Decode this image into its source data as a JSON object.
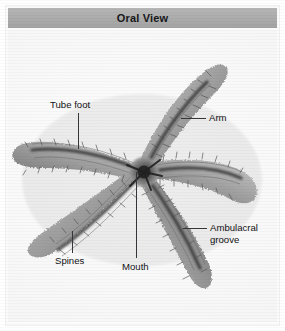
{
  "figure": {
    "header": {
      "title": "Oral View",
      "bar_color": "#ababab",
      "text_color": "#17171a"
    },
    "background_color": "#fcfcfc",
    "labels": [
      {
        "id": "tube-foot",
        "text": "Tube foot"
      },
      {
        "id": "arm",
        "text": "Arm"
      },
      {
        "id": "ambulacral",
        "text": "Ambulacral\ngroove"
      },
      {
        "id": "spines",
        "text": "Spines"
      },
      {
        "id": "mouth",
        "text": "Mouth"
      }
    ],
    "leader_line_color": "#35353a",
    "specimen_colors": {
      "body_light": "#b9b9b9",
      "body_mid": "#8e8e8e",
      "body_dark": "#4a4a4a",
      "groove_dark": "#2b2b2b"
    }
  }
}
